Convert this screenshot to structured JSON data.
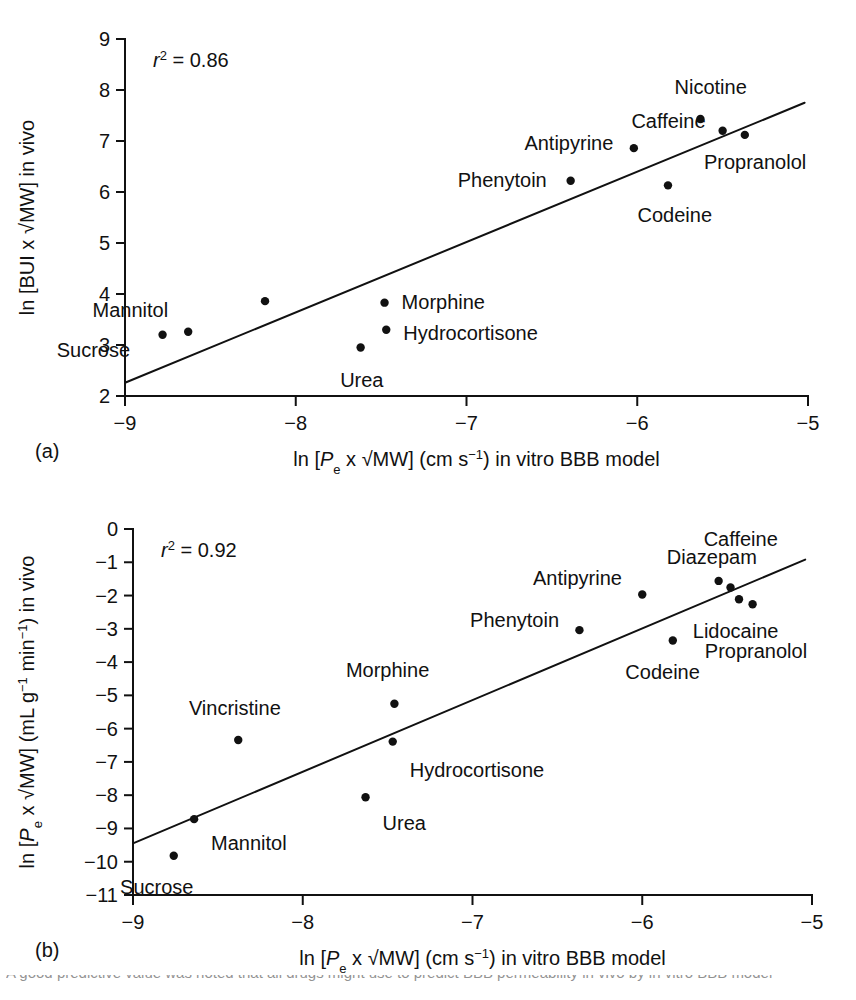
{
  "figure": {
    "background_color": "#ffffff",
    "ink_color": "#111111",
    "caption_clipped_text": "A good predictive value was noted that all drugs might use to predict BBB permeability in vivo by in vitro BBB model"
  },
  "panels": [
    {
      "letter": "(a)",
      "stat_label": "r 2 = 0.86",
      "stat_symbol": "r",
      "stat_exponent": "2",
      "stat_value": "= 0.86",
      "y_axis_title": "ln [BUI x √MW] in vivo",
      "x_axis_title_prefix": "ln [",
      "x_axis_title_italic": "P",
      "x_axis_title_sub": "e",
      "x_axis_title_mid": " x √MW] (cm s",
      "x_axis_title_sup": "−1",
      "x_axis_title_suffix": ") in vitro BBB model",
      "chart_data": {
        "type": "scatter",
        "title": "",
        "xlabel": "ln [Pe x √MW] (cm s−1) in vitro BBB model",
        "ylabel": "ln [BUI x √MW] in vivo",
        "xlim": [
          -9,
          -5
        ],
        "ylim": [
          2,
          9
        ],
        "xticks": [
          -9,
          -8,
          -7,
          -6,
          -5
        ],
        "xtick_labels": [
          "−9",
          "−8",
          "−7",
          "−6",
          "−5"
        ],
        "yticks": [
          2,
          3,
          4,
          5,
          6,
          7,
          8,
          9
        ],
        "ytick_labels": [
          "2",
          "3",
          "4",
          "5",
          "6",
          "7",
          "8",
          "9"
        ],
        "grid": false,
        "legend": "none",
        "annotation": "r² = 0.86",
        "r_squared": 0.86,
        "fit_line": {
          "x": [
            -9,
            -5.02
          ],
          "y": [
            2.26,
            7.75
          ]
        },
        "points": [
          {
            "label": "Sucrose",
            "x": -8.78,
            "y": 3.2,
            "label_dx": -0.62,
            "label_dy": -0.29,
            "label_anchor": "start"
          },
          {
            "label": "Mannitol",
            "x": -8.63,
            "y": 3.26,
            "label_dx": -0.56,
            "label_dy": 0.42,
            "label_anchor": "start"
          },
          {
            "label": "",
            "x": -8.18,
            "y": 3.86,
            "label_dx": 0,
            "label_dy": 0,
            "label_anchor": "start"
          },
          {
            "label": "Urea",
            "x": -7.62,
            "y": 2.95,
            "label_dx": -0.12,
            "label_dy": -0.63,
            "label_anchor": "start"
          },
          {
            "label": "Morphine",
            "x": -7.48,
            "y": 3.83,
            "label_dx": 0.1,
            "label_dy": 0.02,
            "label_anchor": "start"
          },
          {
            "label": "Hydrocortisone",
            "x": -7.47,
            "y": 3.3,
            "label_dx": 0.1,
            "label_dy": -0.07,
            "label_anchor": "start"
          },
          {
            "label": "Phenytoin",
            "x": -6.39,
            "y": 6.22,
            "label_dx": -0.14,
            "label_dy": 0.02,
            "label_anchor": "end"
          },
          {
            "label": "Antipyrine",
            "x": -6.02,
            "y": 6.86,
            "label_dx": -0.12,
            "label_dy": 0.1,
            "label_anchor": "end"
          },
          {
            "label": "Codeine",
            "x": -5.82,
            "y": 6.13,
            "label_dx": 0.04,
            "label_dy": -0.58,
            "label_anchor": "middle"
          },
          {
            "label": "Nicotine",
            "x": -5.63,
            "y": 7.43,
            "label_dx": 0.06,
            "label_dy": 0.63,
            "label_anchor": "middle"
          },
          {
            "label": "Caffeine",
            "x": -5.5,
            "y": 7.2,
            "label_dx": -0.1,
            "label_dy": 0.2,
            "label_anchor": "end"
          },
          {
            "label": "Propranolol",
            "x": -5.37,
            "y": 7.12,
            "label_dx": 0.06,
            "label_dy": -0.53,
            "label_anchor": "middle"
          }
        ]
      }
    },
    {
      "letter": "(b)",
      "stat_label": "r 2 = 0.92",
      "stat_symbol": "r",
      "stat_exponent": "2",
      "stat_value": "= 0.92",
      "y_axis_title_prefix": "ln [",
      "y_axis_title_italic": "P",
      "y_axis_title_sub": "e",
      "y_axis_title_mid": " x √MW] (mL g",
      "y_axis_title_sup1": "−1",
      "y_axis_title_mid2": " min",
      "y_axis_title_sup2": "−1",
      "y_axis_title_suffix": ") in vivo",
      "x_axis_title_prefix": "ln [",
      "x_axis_title_italic": "P",
      "x_axis_title_sub": "e",
      "x_axis_title_mid": " x √MW] (cm s",
      "x_axis_title_sup": "−1",
      "x_axis_title_suffix": ") in vitro BBB model",
      "chart_data": {
        "type": "scatter",
        "title": "",
        "xlabel": "ln [Pe x √MW] (cm s−1) in vitro BBB model",
        "ylabel": "ln [Pe x √MW] (mL g−1 min−1) in vivo",
        "xlim": [
          -9,
          -5
        ],
        "ylim": [
          -11,
          0
        ],
        "xticks": [
          -9,
          -8,
          -7,
          -6,
          -5
        ],
        "xtick_labels": [
          "−9",
          "−8",
          "−7",
          "−6",
          "−5"
        ],
        "yticks": [
          -11,
          -10,
          -9,
          -8,
          -7,
          -6,
          -5,
          -4,
          -3,
          -2,
          -1,
          0
        ],
        "ytick_labels": [
          "−11",
          "−10",
          "−9",
          "−8",
          "−7",
          "−6",
          "−5",
          "−4",
          "−3",
          "−2",
          "−1",
          "0"
        ],
        "grid": false,
        "legend": "none",
        "annotation": "r² = 0.92",
        "r_squared": 0.92,
        "fit_line": {
          "x": [
            -9,
            -5.04
          ],
          "y": [
            -9.45,
            -0.92
          ]
        },
        "points": [
          {
            "label": "Sucrose",
            "x": -8.76,
            "y": -9.82,
            "label_dx": -0.1,
            "label_dy": -0.95,
            "label_anchor": "middle"
          },
          {
            "label": "Mannitol",
            "x": -8.64,
            "y": -8.72,
            "label_dx": 0.1,
            "label_dy": -0.72,
            "label_anchor": "start"
          },
          {
            "label": "Vincristine",
            "x": -8.38,
            "y": -6.34,
            "label_dx": -0.02,
            "label_dy": 0.95,
            "label_anchor": "middle"
          },
          {
            "label": "Urea",
            "x": -7.63,
            "y": -8.06,
            "label_dx": 0.1,
            "label_dy": -0.78,
            "label_anchor": "start"
          },
          {
            "label": "Morphine",
            "x": -7.46,
            "y": -5.25,
            "label_dx": -0.04,
            "label_dy": 1.0,
            "label_anchor": "middle"
          },
          {
            "label": "Hydrocortisone",
            "x": -7.47,
            "y": -6.39,
            "label_dx": 0.1,
            "label_dy": -0.85,
            "label_anchor": "start"
          },
          {
            "label": "Phenytoin",
            "x": -6.37,
            "y": -3.04,
            "label_dx": -0.12,
            "label_dy": 0.3,
            "label_anchor": "end"
          },
          {
            "label": "Antipyrine",
            "x": -6.0,
            "y": -1.97,
            "label_dx": -0.12,
            "label_dy": 0.5,
            "label_anchor": "end"
          },
          {
            "label": "Codeine",
            "x": -5.82,
            "y": -3.35,
            "label_dx": -0.06,
            "label_dy": -0.95,
            "label_anchor": "middle"
          },
          {
            "label": "Diazepam",
            "x": -5.55,
            "y": -1.56,
            "label_dx": -0.04,
            "label_dy": 0.72,
            "label_anchor": "middle"
          },
          {
            "label": "Caffeine",
            "x": -5.48,
            "y": -1.76,
            "label_dx": 0.06,
            "label_dy": 1.45,
            "label_anchor": "middle"
          },
          {
            "label": "Lidocaine",
            "x": -5.43,
            "y": -2.11,
            "label_dx": -0.02,
            "label_dy": -0.95,
            "label_anchor": "middle"
          },
          {
            "label": "Propranolol",
            "x": -5.35,
            "y": -2.26,
            "label_dx": 0.02,
            "label_dy": -1.4,
            "label_anchor": "middle"
          }
        ]
      }
    }
  ]
}
